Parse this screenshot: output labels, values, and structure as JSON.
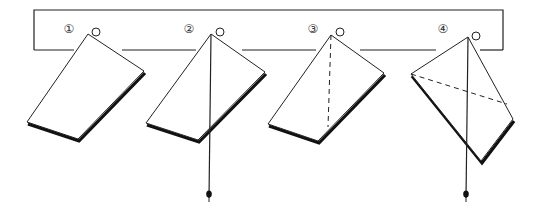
{
  "diagram": {
    "colors": {
      "line": "#222222",
      "background": "#ffffff"
    },
    "board": {
      "x1": 34,
      "x2": 503,
      "top": 10,
      "bottom": 50
    },
    "panels": [
      {
        "label": "①",
        "label_pos": [
          69,
          33
        ],
        "pin": [
          96,
          32
        ],
        "card": {
          "top": [
            88,
            34
          ],
          "right": [
            144,
            71
          ],
          "bottom": [
            78,
            139
          ],
          "left": [
            27,
            122
          ]
        },
        "plumb_line": null,
        "dashed_line": null,
        "board_gap": [
          74,
          122
        ]
      },
      {
        "label": "②",
        "label_pos": [
          189,
          33
        ],
        "pin": [
          220,
          32
        ],
        "card": {
          "top": [
            211,
            34
          ],
          "right": [
            265,
            72
          ],
          "bottom": [
            198,
            140
          ],
          "left": [
            146,
            123
          ]
        },
        "plumb_line": {
          "from": [
            211,
            34
          ],
          "to": [
            209,
            198
          ]
        },
        "dashed_line": null,
        "board_gap": [
          196,
          242
        ]
      },
      {
        "label": "③",
        "label_pos": [
          313,
          33
        ],
        "pin": [
          340,
          32
        ],
        "card": {
          "top": [
            331,
            35
          ],
          "right": [
            384,
            73
          ],
          "bottom": [
            318,
            141
          ],
          "left": [
            268,
            124
          ]
        },
        "plumb_line": null,
        "dashed_line": {
          "from": [
            331,
            35
          ],
          "to": [
            328,
            127
          ]
        },
        "board_gap": [
          316,
          360
        ]
      },
      {
        "label": "④",
        "label_pos": [
          443,
          33
        ],
        "pin": [
          476,
          36
        ],
        "card": {
          "top": [
            468,
            37
          ],
          "right": [
            513,
            119
          ],
          "bottom": [
            481,
            161
          ],
          "left": [
            411,
            74
          ]
        },
        "plumb_line": {
          "from": [
            468,
            37
          ],
          "to": [
            466,
            198
          ]
        },
        "dashed_line": {
          "from": [
            411,
            74
          ],
          "to": [
            507,
            104
          ]
        },
        "board_gap": [
          436,
          480
        ]
      }
    ]
  }
}
